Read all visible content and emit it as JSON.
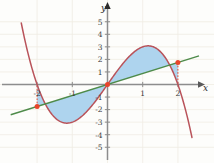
{
  "chart_data": {
    "type": "line",
    "title": "",
    "xlabel": "x",
    "ylabel": "y",
    "xlim": [
      -2.75,
      2.6
    ],
    "ylim": [
      -6.4,
      6.0
    ],
    "grid": true,
    "legend": "none",
    "xticks": [
      -2,
      -1,
      1,
      2
    ],
    "yticks": [
      -5,
      -4,
      -3,
      -2,
      -1,
      1,
      2,
      3,
      4,
      5
    ],
    "xtick_labels": [
      "-2",
      "-1",
      "1",
      "2"
    ],
    "ytick_labels": [
      "-5",
      "-4",
      "-3",
      "-2",
      "-1",
      "1",
      "2",
      "3",
      "4",
      "5"
    ],
    "series": [
      {
        "name": "cubic-curve",
        "type": "line",
        "color": "#b9535a",
        "expression": "y = -x^3 + 4x",
        "x": [
          -2.45,
          -2.3,
          -2.2,
          -2.1,
          -2.0,
          -1.9,
          -1.8,
          -1.7,
          -1.6,
          -1.5,
          -1.4,
          -1.3,
          -1.2,
          -1.1,
          -1.0,
          -0.9,
          -0.8,
          -0.7,
          -0.6,
          -0.5,
          -0.4,
          -0.3,
          -0.2,
          -0.1,
          0.0,
          0.1,
          0.2,
          0.3,
          0.4,
          0.5,
          0.6,
          0.7,
          0.8,
          0.9,
          1.0,
          1.1,
          1.2,
          1.3,
          1.4,
          1.5,
          1.6,
          1.7,
          1.8,
          1.9,
          2.0,
          2.1,
          2.2,
          2.3,
          2.4
        ],
        "values": [
          4.9,
          3.0,
          1.85,
          0.86,
          0.0,
          -0.74,
          -1.37,
          -1.89,
          -2.3,
          -2.63,
          -2.86,
          -3.0,
          -3.07,
          -3.07,
          -3.0,
          -2.87,
          -2.69,
          -2.46,
          -2.18,
          -1.88,
          -1.54,
          -1.17,
          -0.79,
          -0.4,
          0.0,
          0.4,
          0.79,
          1.17,
          1.54,
          1.88,
          2.18,
          2.46,
          2.69,
          2.87,
          3.0,
          3.07,
          3.07,
          3.0,
          2.86,
          2.63,
          2.3,
          1.89,
          1.37,
          0.74,
          0.0,
          -0.86,
          -1.85,
          -3.0,
          -4.39
        ]
      },
      {
        "name": "straight-line",
        "type": "line",
        "color": "#4e8b4a",
        "expression": "y = 0.875x",
        "x": [
          -2.75,
          2.6
        ],
        "values": [
          -2.41,
          2.28
        ]
      }
    ],
    "filled_regions": [
      {
        "name": "left-lobe",
        "x_range": [
          -2,
          0
        ],
        "fill": "#aed4ee",
        "between": [
          "cubic-curve",
          "straight-line"
        ]
      },
      {
        "name": "right-lobe",
        "x_range": [
          0,
          2
        ],
        "fill": "#aed4ee",
        "between": [
          "cubic-curve",
          "straight-line"
        ]
      }
    ],
    "points": [
      {
        "name": "intersection-left",
        "x": -2,
        "y": -1.75,
        "color": "#e8452c"
      },
      {
        "name": "intersection-origin",
        "x": 0,
        "y": 0,
        "color": "#e8452c"
      },
      {
        "name": "intersection-right",
        "x": 2,
        "y": 1.75,
        "color": "#e8452c"
      }
    ],
    "dropline_color": "#e8452c",
    "axis_color": "#8d8d8d",
    "grid_color": "#f0ece3",
    "background": "#fdfdfb"
  }
}
